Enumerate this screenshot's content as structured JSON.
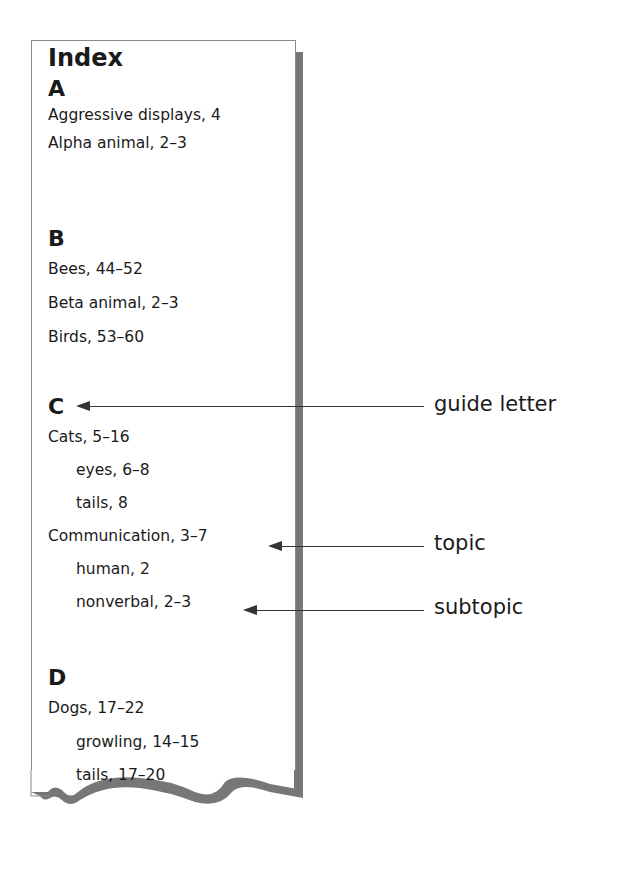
{
  "index": {
    "title": "Index",
    "sections": [
      {
        "letter": "A",
        "entries": [
          {
            "text": "Aggressive displays, 4",
            "level": "topic"
          },
          {
            "text": "Alpha animal, 2–3",
            "level": "topic"
          }
        ]
      },
      {
        "letter": "B",
        "entries": [
          {
            "text": "Bees, 44–52",
            "level": "topic"
          },
          {
            "text": "Beta animal, 2–3",
            "level": "topic"
          },
          {
            "text": "Birds, 53–60",
            "level": "topic"
          }
        ]
      },
      {
        "letter": "C",
        "entries": [
          {
            "text": "Cats, 5–16",
            "level": "topic"
          },
          {
            "text": "eyes, 6–8",
            "level": "subtopic"
          },
          {
            "text": "tails, 8",
            "level": "subtopic"
          },
          {
            "text": "Communication, 3–7",
            "level": "topic"
          },
          {
            "text": "human, 2",
            "level": "subtopic"
          },
          {
            "text": "nonverbal, 2–3",
            "level": "subtopic"
          }
        ]
      },
      {
        "letter": "D",
        "entries": [
          {
            "text": "Dogs, 17–22",
            "level": "topic"
          },
          {
            "text": "growling, 14–15",
            "level": "subtopic"
          },
          {
            "text": "tails, 17–20",
            "level": "subtopic"
          }
        ]
      }
    ]
  },
  "callouts": [
    {
      "label": "guide letter",
      "target": "C"
    },
    {
      "label": "topic",
      "target": "Communication, 3–7"
    },
    {
      "label": "subtopic",
      "target": "nonverbal, 2–3"
    }
  ],
  "colors": {
    "shadow": "#777777",
    "border": "#8a8a8a",
    "text": "#1a1a1a",
    "arrow": "#333333"
  }
}
